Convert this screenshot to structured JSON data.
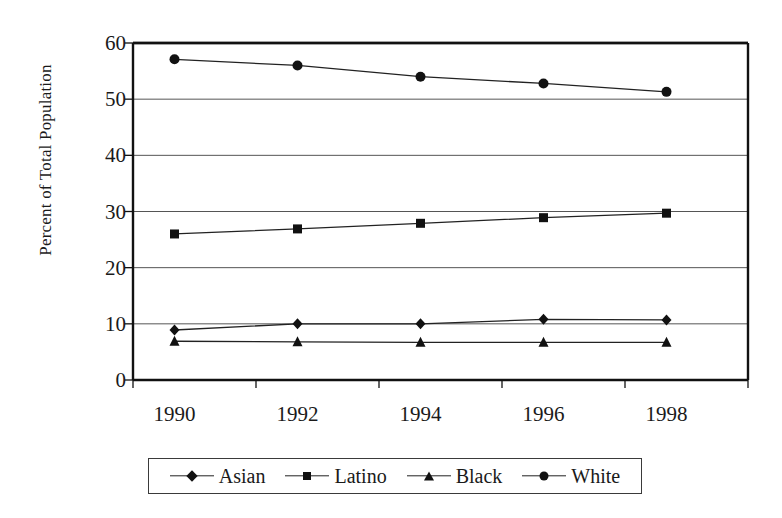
{
  "chart_data": {
    "type": "line",
    "title": "",
    "xlabel": "",
    "ylabel": "Percent of Total Population",
    "categories": [
      "1990",
      "1992",
      "1994",
      "1996",
      "1998"
    ],
    "ylim": [
      0,
      60
    ],
    "yticks": [
      "0",
      "10",
      "20",
      "30",
      "40",
      "50",
      "60"
    ],
    "grid": "horizontal",
    "legend_position": "bottom",
    "series": [
      {
        "name": "Asian",
        "marker": "diamond",
        "values": [
          8.9,
          10.0,
          10.0,
          10.8,
          10.7
        ]
      },
      {
        "name": "Latino",
        "marker": "square",
        "values": [
          26.0,
          26.9,
          27.9,
          28.9,
          29.7
        ]
      },
      {
        "name": "Black",
        "marker": "triangle",
        "values": [
          6.9,
          6.8,
          6.7,
          6.7,
          6.7
        ]
      },
      {
        "name": "White",
        "marker": "circle",
        "values": [
          57.1,
          56.0,
          54.0,
          52.8,
          51.3
        ]
      }
    ]
  },
  "colors": {
    "line": "#222222",
    "marker": "#111111",
    "grid": "#555555",
    "axis": "#111111",
    "background": "#ffffff"
  },
  "scan_artifact": "",
  "legend": {
    "items": [
      {
        "label": "Asian"
      },
      {
        "label": "Latino"
      },
      {
        "label": "Black"
      },
      {
        "label": "White"
      }
    ]
  }
}
